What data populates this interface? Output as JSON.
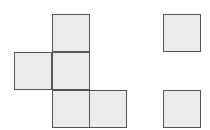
{
  "diagram": {
    "fill_color": "#ebebeb",
    "stroke_color": "#555555",
    "squares": [
      {
        "id": "net-top",
        "x": 52,
        "y": 14
      },
      {
        "id": "net-middle-left",
        "x": 14,
        "y": 52
      },
      {
        "id": "net-middle-center",
        "x": 52,
        "y": 52
      },
      {
        "id": "net-bottom-center",
        "x": 52,
        "y": 90
      },
      {
        "id": "net-bottom-right",
        "x": 89,
        "y": 90
      },
      {
        "id": "separate-top",
        "x": 163,
        "y": 14
      },
      {
        "id": "separate-bottom",
        "x": 163,
        "y": 90
      }
    ],
    "square_size": 38
  }
}
